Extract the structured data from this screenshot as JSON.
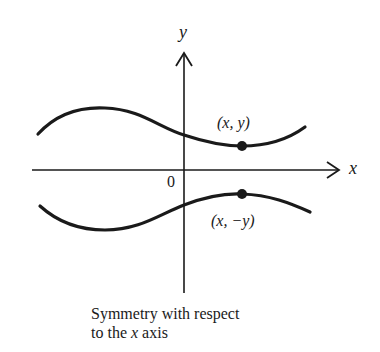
{
  "diagram": {
    "axes": {
      "x_label": "x",
      "y_label": "y",
      "origin_label": "0"
    },
    "points": {
      "upper": "(x, y)",
      "lower": "(x, −y)"
    },
    "caption": {
      "line1": "Symmetry with respect",
      "line2_prefix": "to the ",
      "line2_var": "x",
      "line2_suffix": " axis"
    },
    "colors": {
      "ink": "#1a1a1a",
      "background": "#ffffff"
    }
  }
}
